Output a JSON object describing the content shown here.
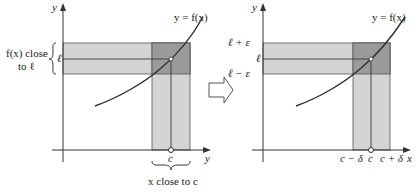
{
  "figure": {
    "colors": {
      "background": "#ffffff",
      "band_light": "#d4d4d4",
      "band_dark": "#9a9a9a",
      "line": "#3a3a3a",
      "curve": "#2e2e2e",
      "text": "#222222"
    },
    "left_panel": {
      "y_axis_label": "y",
      "x_axis_label": "y",
      "curve_label": "y = f(x)",
      "l_tick_label": "ℓ",
      "c_tick_label": "c",
      "y_brace_label_line1": "f(x) close",
      "y_brace_label_line2": "to ℓ",
      "x_brace_label": "x close to c"
    },
    "arrow": {
      "icon": "implies-arrow-icon"
    },
    "right_panel": {
      "y_axis_label": "y",
      "x_axis_label": "x",
      "curve_label": "y = f(x)",
      "y_tick_labels": [
        "ℓ + ε",
        "ℓ",
        "ℓ − ε"
      ],
      "x_tick_labels": [
        "c − δ",
        "c",
        "c + δ"
      ]
    }
  }
}
